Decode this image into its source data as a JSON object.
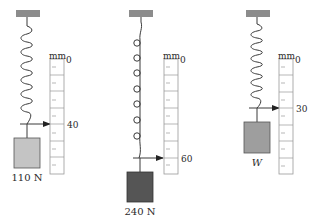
{
  "diagram": {
    "unit_label": "mm",
    "colors": {
      "ceiling": "#8c8c8c",
      "block_light": "#c4c4c4",
      "block_dark": "#555555",
      "line": "#3a3a3a",
      "scale_border": "#9a9a9a"
    },
    "panels": [
      {
        "id": "spring-1",
        "weight_label": "110 N",
        "scale_zero": "0",
        "reading_label": "40",
        "reading_mm": 40
      },
      {
        "id": "spring-2",
        "weight_label": "240 N",
        "scale_zero": "0",
        "reading_label": "60",
        "reading_mm": 60
      },
      {
        "id": "spring-3",
        "weight_label": "W",
        "scale_zero": "0",
        "reading_label": "30",
        "reading_mm": 30
      }
    ]
  }
}
